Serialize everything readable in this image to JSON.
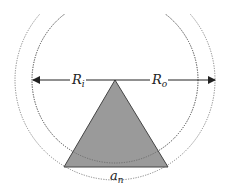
{
  "diagram": {
    "labels": {
      "inner_radius": {
        "main": "R",
        "sub": "i"
      },
      "outer_radius": {
        "main": "R",
        "sub": "o"
      },
      "side_length": {
        "main": "a",
        "sub": "n"
      }
    },
    "colors": {
      "triangle_fill": "#9a9a9a",
      "triangle_stroke": "#444444",
      "circle_stroke": "#777777",
      "arrow": "#222222"
    }
  }
}
